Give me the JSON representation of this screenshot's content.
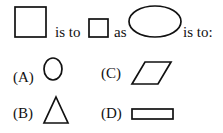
{
  "question": {
    "prefix_shape": "large-square",
    "text_is_to_1": "is to",
    "middle_shape": "small-square",
    "text_as": "as",
    "query_shape": "horizontal-ellipse",
    "text_is_to_2": "is to:"
  },
  "options": [
    {
      "label": "(A)",
      "shape": "vertical-ellipse"
    },
    {
      "label": "(B)",
      "shape": "triangle"
    },
    {
      "label": "(C)",
      "shape": "parallelogram"
    },
    {
      "label": "(D)",
      "shape": "thin-rectangle"
    }
  ]
}
